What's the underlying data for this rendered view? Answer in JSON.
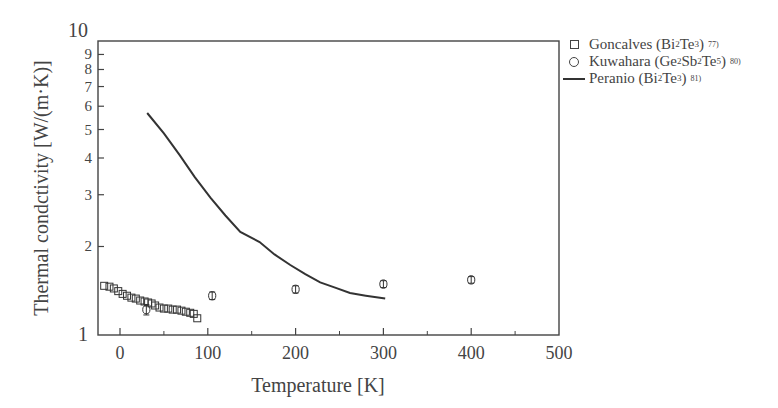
{
  "chart_data": {
    "type": "scatter",
    "title": "",
    "xlabel": "Temperature [K]",
    "ylabel": "Thermal condctivity [W/(m·K)]",
    "xlim": [
      -25,
      500
    ],
    "ylim": [
      1,
      10
    ],
    "yscale": "log",
    "grid": false,
    "legend_position": "outside-right-top",
    "x_ticks": [
      0,
      100,
      200,
      300,
      400,
      500
    ],
    "x_minor_ticks": [
      50,
      150,
      250,
      350,
      450
    ],
    "y_tick_labels": [
      "1",
      "2",
      "3",
      "4",
      "5",
      "6",
      "7",
      "8",
      "9",
      "10"
    ],
    "y_ticks": [
      1,
      2,
      3,
      4,
      5,
      6,
      7,
      8,
      9,
      10
    ],
    "series": [
      {
        "name": "Goncalves (Bi2Te3) 77)",
        "marker": "square",
        "x": [
          -18,
          -12,
          -7,
          -2,
          3,
          8,
          13,
          18,
          23,
          28,
          32,
          36,
          40,
          45,
          50,
          55,
          60,
          65,
          70,
          75,
          80,
          84,
          88
        ],
        "y": [
          1.47,
          1.46,
          1.44,
          1.41,
          1.38,
          1.36,
          1.34,
          1.33,
          1.31,
          1.3,
          1.29,
          1.28,
          1.26,
          1.24,
          1.23,
          1.23,
          1.22,
          1.22,
          1.21,
          1.2,
          1.19,
          1.18,
          1.14
        ]
      },
      {
        "name": "Kuwahara (Ge2Sb2Te5) 80)",
        "marker": "circle",
        "x": [
          30,
          105,
          200,
          300,
          400
        ],
        "y": [
          1.22,
          1.36,
          1.43,
          1.49,
          1.54
        ],
        "yerr": [
          0.05,
          0.04,
          0.04,
          0.04,
          0.04
        ]
      },
      {
        "name": "Peranio (Bi2Te3) 81)",
        "marker": "line",
        "x": [
          31,
          50,
          68,
          85,
          103,
          120,
          137,
          159,
          176,
          194,
          211,
          228,
          245,
          262,
          280,
          302
        ],
        "y": [
          5.69,
          4.85,
          4.09,
          3.45,
          2.93,
          2.55,
          2.24,
          2.07,
          1.88,
          1.73,
          1.61,
          1.51,
          1.45,
          1.39,
          1.36,
          1.33
        ]
      }
    ]
  },
  "legend": {
    "items": [
      {
        "label": "Goncalves (Bi",
        "sub1": "2",
        "mid": "Te",
        "sub2": "3",
        "tail": ")",
        "ref": "77)"
      },
      {
        "label": "Kuwahara (Ge",
        "sub1": "2",
        "mid": "Sb",
        "sub2": "2",
        "mid2": "Te",
        "sub3": "5",
        "tail": ")",
        "ref": "80)"
      },
      {
        "label": "Peranio (Bi",
        "sub1": "2",
        "mid": "Te",
        "sub2": "3",
        "tail": ")",
        "ref": "81)"
      }
    ]
  },
  "colors": {
    "ink": "#333333",
    "axis": "#444444",
    "background": "#ffffff"
  }
}
